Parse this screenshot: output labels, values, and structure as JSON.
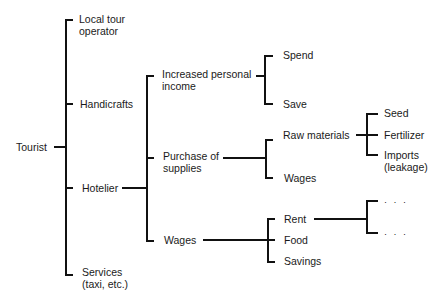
{
  "diagram": {
    "type": "tree",
    "root": {
      "label": "Tourist",
      "children": [
        {
          "label": "Local tour operator"
        },
        {
          "label": "Handicrafts"
        },
        {
          "label": "Hotelier",
          "children": [
            {
              "label": "Increased personal income",
              "children": [
                {
                  "label": "Spend"
                },
                {
                  "label": "Save"
                }
              ]
            },
            {
              "label": "Purchase of supplies",
              "children": [
                {
                  "label": "Raw materials",
                  "children": [
                    {
                      "label": "Seed"
                    },
                    {
                      "label": "Fertilizer"
                    },
                    {
                      "label": "Imports (leakage)"
                    }
                  ]
                },
                {
                  "label": "Wages"
                }
              ]
            },
            {
              "label": "Wages",
              "children": [
                {
                  "label": "Rent",
                  "children": [
                    {
                      "label": "..."
                    },
                    {
                      "label": "..."
                    }
                  ]
                },
                {
                  "label": "Food"
                },
                {
                  "label": "Savings"
                }
              ]
            }
          ]
        },
        {
          "label": "Services (taxi, etc.)"
        }
      ]
    }
  },
  "labels": {
    "tourist": "Tourist",
    "local_tour_1": "Local tour",
    "local_tour_2": "operator",
    "handicrafts": "Handicrafts",
    "hotelier": "Hotelier",
    "services_1": "Services",
    "services_2": "(taxi, etc.)",
    "income_1": "Increased personal",
    "income_2": "income",
    "supplies_1": "Purchase of",
    "supplies_2": "supplies",
    "wages_hotel": "Wages",
    "spend": "Spend",
    "save": "Save",
    "raw_materials": "Raw materials",
    "wages_supplies": "Wages",
    "rent": "Rent",
    "food": "Food",
    "savings": "Savings",
    "seed": "Seed",
    "fertilizer": "Fertilizer",
    "imports_1": "Imports",
    "imports_2": "(leakage)",
    "ellipsis_1": "· · ·",
    "ellipsis_2": "· · ·"
  }
}
